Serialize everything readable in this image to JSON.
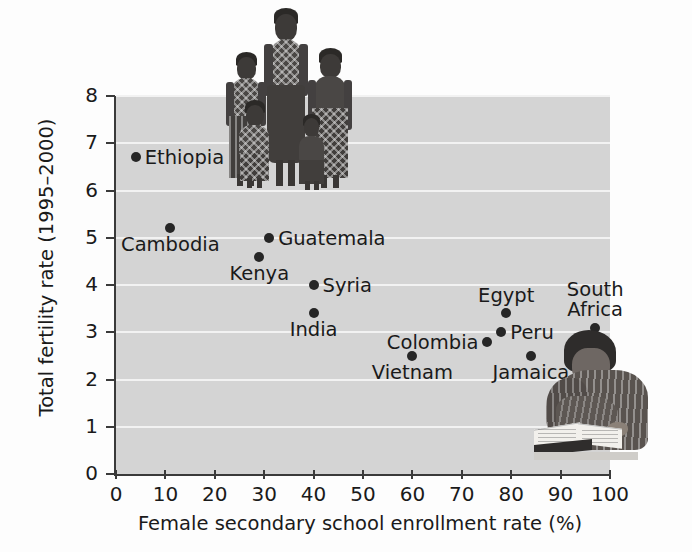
{
  "chart_data": {
    "type": "scatter",
    "title": "",
    "subtitle": "",
    "xlabel": "Female secondary school enrollment rate (%)",
    "ylabel": "Total fertility rate (1995–2000)",
    "xlim": [
      0,
      100
    ],
    "ylim": [
      0,
      8
    ],
    "xticks": [
      "0",
      "10",
      "20",
      "30",
      "40",
      "50",
      "60",
      "70",
      "80",
      "90",
      "100"
    ],
    "yticks": [
      "0",
      "1",
      "2",
      "3",
      "4",
      "5",
      "6",
      "7",
      "8"
    ],
    "grid": "horizontal",
    "legend": "none",
    "plot_background": "#d4d4d4",
    "gridline_color": "#f2f2f2",
    "point_color": "#262626",
    "points": [
      {
        "label": "Ethiopia",
        "x": 4,
        "y": 6.7,
        "label_pos": "right"
      },
      {
        "label": "Cambodia",
        "x": 11,
        "y": 5.2,
        "label_pos": "below"
      },
      {
        "label": "Kenya",
        "x": 29,
        "y": 4.6,
        "label_pos": "below"
      },
      {
        "label": "Guatemala",
        "x": 31,
        "y": 5.0,
        "label_pos": "right"
      },
      {
        "label": "Syria",
        "x": 40,
        "y": 4.0,
        "label_pos": "right"
      },
      {
        "label": "India",
        "x": 40,
        "y": 3.4,
        "label_pos": "below"
      },
      {
        "label": "Vietnam",
        "x": 60,
        "y": 2.5,
        "label_pos": "below"
      },
      {
        "label": "Colombia",
        "x": 75,
        "y": 2.8,
        "label_pos": "left"
      },
      {
        "label": "Egypt",
        "x": 79,
        "y": 3.4,
        "label_pos": "above"
      },
      {
        "label": "Peru",
        "x": 78,
        "y": 3.0,
        "label_pos": "right"
      },
      {
        "label": "Jamaica",
        "x": 84,
        "y": 2.5,
        "label_pos": "below"
      },
      {
        "label": "South Africa",
        "x": 97,
        "y": 3.1,
        "label_pos": "above"
      }
    ],
    "images": [
      {
        "name": "photo-women-and-children",
        "description": "group of women and children standing"
      },
      {
        "name": "photo-woman-reading",
        "description": "woman reading an open book at a desk"
      }
    ]
  }
}
